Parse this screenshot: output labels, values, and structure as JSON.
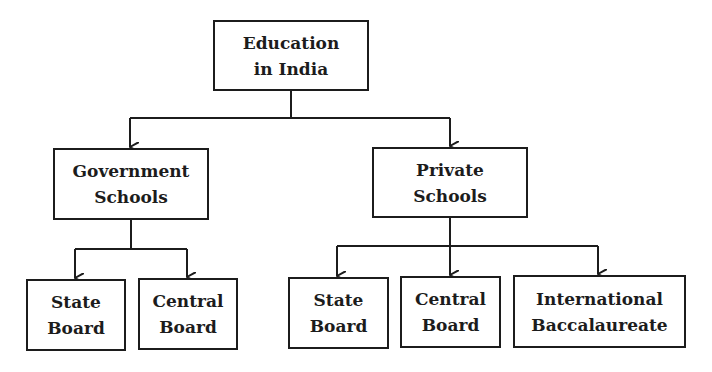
{
  "diagram": {
    "type": "hierarchy",
    "root": {
      "id": "education-in-india",
      "lines": [
        "Education",
        "in India"
      ]
    },
    "level1": [
      {
        "id": "government-schools",
        "lines": [
          "Government",
          "Schools"
        ],
        "children": [
          {
            "id": "gov-state-board",
            "lines": [
              "State",
              "Board"
            ]
          },
          {
            "id": "gov-central-board",
            "lines": [
              "Central",
              "Board"
            ]
          }
        ]
      },
      {
        "id": "private-schools",
        "lines": [
          "Private",
          "Schools"
        ],
        "children": [
          {
            "id": "private-state-board",
            "lines": [
              "State",
              "Board"
            ]
          },
          {
            "id": "private-central-board",
            "lines": [
              "Central",
              "Board"
            ]
          },
          {
            "id": "private-international-baccalaureate",
            "lines": [
              "International",
              "Baccalaureate"
            ]
          }
        ]
      }
    ],
    "edges": [
      [
        "Education in India",
        "Government Schools"
      ],
      [
        "Education in India",
        "Private Schools"
      ],
      [
        "Government Schools",
        "State Board"
      ],
      [
        "Government Schools",
        "Central Board"
      ],
      [
        "Private Schools",
        "State Board"
      ],
      [
        "Private Schools",
        "Central Board"
      ],
      [
        "Private Schools",
        "International Baccalaureate"
      ]
    ],
    "colors": {
      "line": "#1c1c1c",
      "box_border": "#1c1c1c",
      "text": "#1c1c1c",
      "background": "#ffffff"
    }
  }
}
